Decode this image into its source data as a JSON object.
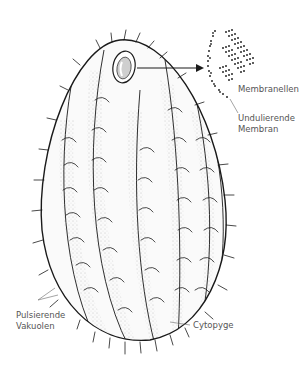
{
  "diagram": {
    "colors": {
      "ink": "#1a1a1a",
      "label_text": "#555555",
      "background": "#ffffff"
    },
    "labels": {
      "membranellen": "Membranellen",
      "undulierende_line1": "Undulierende",
      "undulierende_line2": "Membran",
      "pulsierende_line1": "Pulsierende",
      "pulsierende_line2": "Vakuolen",
      "cytopyge": "Cytopyge"
    }
  }
}
